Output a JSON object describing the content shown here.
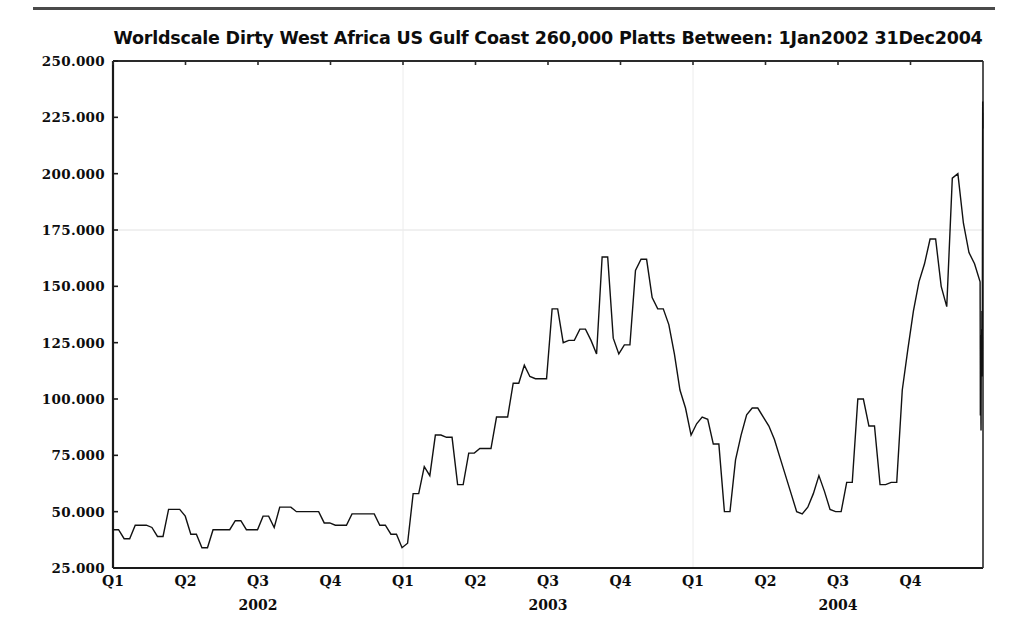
{
  "document": {
    "has_top_rule": true,
    "background_color": "#ffffff",
    "ink_color": "#111111"
  },
  "chart_data": {
    "type": "line",
    "title": "Worldscale Dirty West Africa US Gulf Coast 260,000 Platts Between: 1Jan2002 31Dec2004",
    "xlabel": "",
    "ylabel": "",
    "ylim": [
      25.0,
      250.0
    ],
    "yticks": [
      25.0,
      50.0,
      75.0,
      100.0,
      125.0,
      150.0,
      175.0,
      200.0,
      225.0,
      250.0
    ],
    "ytick_labels": [
      "25.000",
      "50.000",
      "75.000",
      "100.000",
      "125.000",
      "150.000",
      "175.000",
      "200.000",
      "225.000",
      "250.000"
    ],
    "xlim": [
      0,
      36
    ],
    "xtick_labels": [
      "Q1",
      "Q2",
      "Q3",
      "Q4",
      "Q1",
      "Q2",
      "Q3",
      "Q4",
      "Q1",
      "Q2",
      "Q3",
      "Q4"
    ],
    "xtick_positions_months": [
      0,
      3,
      6,
      9,
      12,
      15,
      18,
      21,
      24,
      27,
      30,
      33
    ],
    "year_labels": [
      "2002",
      "2003",
      "2004"
    ],
    "year_label_positions_months": [
      6,
      18,
      30
    ],
    "grid": "faint-gridlines",
    "gridlines_y": [
      175.0
    ],
    "gridlines_x_months": [
      12,
      24
    ],
    "legend": "none",
    "line_color": "#111111",
    "line_width": 1.4,
    "series_name": "Worldscale Dirty WAF-USGC 260kt Platts",
    "x_unit": "months from 1Jan2002",
    "n_points": 157,
    "x": [
      0.0,
      0.23,
      0.46,
      0.69,
      0.92,
      1.15,
      1.38,
      1.61,
      1.84,
      2.07,
      2.3,
      2.53,
      2.76,
      2.99,
      3.22,
      3.45,
      3.68,
      3.91,
      4.14,
      4.37,
      4.6,
      4.83,
      5.06,
      5.29,
      5.52,
      5.75,
      5.98,
      6.21,
      6.44,
      6.67,
      6.9,
      7.13,
      7.36,
      7.59,
      7.82,
      8.05,
      8.28,
      8.51,
      8.74,
      8.97,
      9.2,
      9.43,
      9.66,
      9.89,
      10.12,
      10.35,
      10.58,
      10.81,
      11.04,
      11.27,
      11.5,
      11.73,
      11.96,
      12.19,
      12.42,
      12.65,
      12.88,
      13.11,
      13.34,
      13.57,
      13.8,
      14.03,
      14.26,
      14.49,
      14.72,
      14.95,
      15.18,
      15.41,
      15.64,
      15.87,
      16.1,
      16.33,
      16.56,
      16.79,
      17.02,
      17.25,
      17.48,
      17.71,
      17.94,
      18.17,
      18.4,
      18.63,
      18.86,
      19.09,
      19.32,
      19.55,
      19.78,
      20.01,
      20.24,
      20.47,
      20.7,
      20.93,
      21.16,
      21.39,
      21.62,
      21.85,
      22.08,
      22.31,
      22.54,
      22.77,
      23.0,
      23.23,
      23.46,
      23.69,
      23.92,
      24.15,
      24.38,
      24.61,
      24.84,
      25.07,
      25.3,
      25.53,
      25.76,
      25.99,
      26.22,
      26.45,
      26.68,
      26.91,
      27.14,
      27.37,
      27.6,
      27.83,
      28.06,
      28.29,
      28.52,
      28.75,
      28.98,
      29.21,
      29.44,
      29.67,
      29.9,
      30.13,
      30.36,
      30.59,
      30.82,
      31.05,
      31.28,
      31.51,
      31.74,
      31.97,
      32.2,
      32.43,
      32.66,
      32.89,
      33.12,
      33.35,
      33.58,
      33.81,
      34.04,
      34.27,
      34.5,
      34.73,
      34.96,
      35.19,
      35.42,
      35.65,
      35.88
    ],
    "values": [
      42,
      42,
      38,
      38,
      44,
      44,
      44,
      43,
      39,
      39,
      51,
      51,
      51,
      48,
      40,
      40,
      34,
      34,
      42,
      42,
      42,
      42,
      46,
      46,
      42,
      42,
      42,
      48,
      48,
      43,
      52,
      52,
      52,
      50,
      50,
      50,
      50,
      50,
      45,
      45,
      44,
      44,
      44,
      49,
      49,
      49,
      49,
      49,
      44,
      44,
      40,
      40,
      34,
      36,
      58,
      58,
      70,
      66,
      84,
      84,
      83,
      83,
      62,
      62,
      76,
      76,
      78,
      78,
      78,
      92,
      92,
      92,
      107,
      107,
      115,
      110,
      109,
      109,
      109,
      140,
      140,
      125,
      126,
      126,
      131,
      131,
      126,
      120,
      163,
      163,
      127,
      120,
      124,
      124,
      157,
      162,
      162,
      145,
      140,
      140,
      133,
      120,
      104,
      96,
      84,
      89,
      92,
      91,
      80,
      80,
      50,
      50,
      73,
      84,
      93,
      96,
      96,
      92,
      88,
      82,
      74,
      66,
      58,
      50,
      49,
      52,
      58,
      66,
      59,
      51,
      50,
      50,
      63,
      63,
      100,
      100,
      88,
      88,
      62,
      62,
      63,
      63,
      104,
      122,
      139,
      152,
      160,
      171,
      171,
      150,
      141,
      198,
      200,
      178,
      165,
      160,
      152
    ],
    "values_continued": [
      140,
      128,
      115,
      93,
      93,
      128,
      128,
      126,
      113,
      113,
      113,
      106,
      96,
      89,
      86,
      90,
      103,
      111,
      112,
      121,
      117,
      126,
      120,
      121,
      119,
      131,
      126,
      124,
      139,
      126,
      119,
      119,
      118,
      110,
      113,
      122,
      148,
      171,
      192,
      211,
      224,
      232,
      230,
      225,
      227,
      220
    ],
    "annotations": []
  },
  "axes": {
    "y_axis_name": "worldscale-rate",
    "x_axis_name": "quarter-timeline"
  }
}
